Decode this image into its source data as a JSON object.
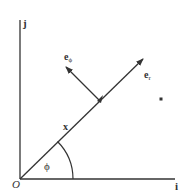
{
  "diagram": {
    "axes": {
      "vertical_label": "j",
      "horizontal_label": "i",
      "origin_label": "O"
    },
    "vectors": {
      "position_label": "x",
      "radial_unit_label": "e",
      "radial_unit_sub": "r",
      "angular_unit_label": "e",
      "angular_unit_sub": "ϕ"
    },
    "angle_label": "ϕ",
    "colors": {
      "line": "#333333",
      "background": "#ffffff"
    }
  }
}
